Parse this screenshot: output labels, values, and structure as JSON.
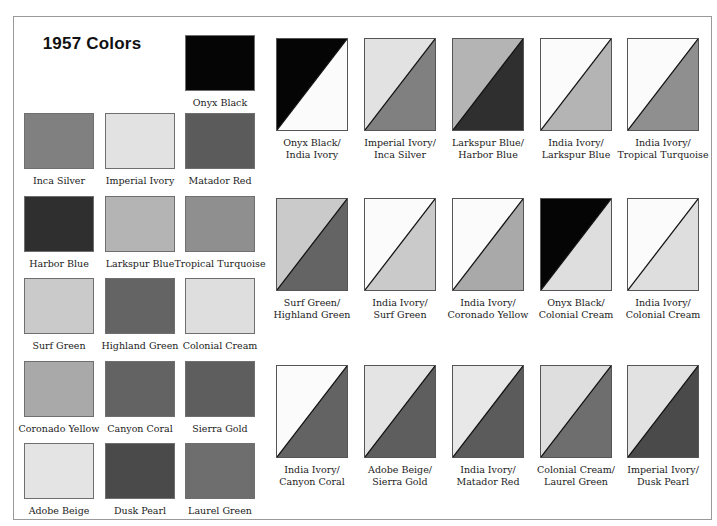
{
  "title": "1957 Colors",
  "colors": {
    "onyx_black": "#050505",
    "india_ivory": "#fbfbfb",
    "inca_silver": "#808080",
    "imperial_ivory": "#e2e2e2",
    "matador_red": "#5b5b5b",
    "harbor_blue": "#2f2f2f",
    "larkspur_blue": "#b4b4b4",
    "tropical_turquoise": "#8f8f8f",
    "surf_green": "#cacaca",
    "highland_green": "#646464",
    "colonial_cream": "#dedede",
    "coronado_yellow": "#a9a9a9",
    "canyon_coral": "#636363",
    "sierra_gold": "#5e5e5e",
    "adobe_beige": "#e4e4e4",
    "dusk_pearl": "#4a4a4a",
    "laurel_green": "#6e6e6e"
  },
  "solid_swatches": [
    {
      "label": "Onyx Black",
      "color": "#050505"
    },
    {
      "label": "Inca Silver",
      "color": "#808080"
    },
    {
      "label": "Imperial Ivory",
      "color": "#e2e2e2"
    },
    {
      "label": "Matador Red",
      "color": "#5b5b5b"
    },
    {
      "label": "Harbor Blue",
      "color": "#2f2f2f"
    },
    {
      "label": "Larkspur Blue",
      "color": "#b4b4b4"
    },
    {
      "label": "Tropical Turquoise",
      "color": "#8f8f8f"
    },
    {
      "label": "Surf Green",
      "color": "#cacaca"
    },
    {
      "label": "Highland Green",
      "color": "#646464"
    },
    {
      "label": "Colonial Cream",
      "color": "#dedede"
    },
    {
      "label": "Coronado Yellow",
      "color": "#a9a9a9"
    },
    {
      "label": "Canyon Coral",
      "color": "#636363"
    },
    {
      "label": "Sierra Gold",
      "color": "#5e5e5e"
    },
    {
      "label": "Adobe Beige",
      "color": "#e4e4e4"
    },
    {
      "label": "Dusk Pearl",
      "color": "#4a4a4a"
    },
    {
      "label": "Laurel Green",
      "color": "#6e6e6e"
    }
  ],
  "two_tone_combos": [
    {
      "line1": "Onyx Black/",
      "line2": "India Ivory",
      "upper": "#050505",
      "lower": "#fbfbfb"
    },
    {
      "line1": "Imperial Ivory/",
      "line2": "Inca Silver",
      "upper": "#e2e2e2",
      "lower": "#808080"
    },
    {
      "line1": "Larkspur Blue/",
      "line2": "Harbor Blue",
      "upper": "#b4b4b4",
      "lower": "#2f2f2f"
    },
    {
      "line1": "India Ivory/",
      "line2": "Larkspur Blue",
      "upper": "#fbfbfb",
      "lower": "#b4b4b4"
    },
    {
      "line1": "India Ivory/",
      "line2": "Tropical Turquoise",
      "upper": "#fbfbfb",
      "lower": "#8f8f8f"
    },
    {
      "line1": "Surf Green/",
      "line2": "Highland Green",
      "upper": "#cacaca",
      "lower": "#646464"
    },
    {
      "line1": "India Ivory/",
      "line2": "Surf Green",
      "upper": "#fbfbfb",
      "lower": "#cacaca"
    },
    {
      "line1": "India Ivory/",
      "line2": "Coronado Yellow",
      "upper": "#fbfbfb",
      "lower": "#a9a9a9"
    },
    {
      "line1": "Onyx Black/",
      "line2": "Colonial Cream",
      "upper": "#050505",
      "lower": "#dedede"
    },
    {
      "line1": "India Ivory/",
      "line2": "Colonial Cream",
      "upper": "#fbfbfb",
      "lower": "#dedede"
    },
    {
      "line1": "India Ivory/",
      "line2": "Canyon Coral",
      "upper": "#fbfbfb",
      "lower": "#636363"
    },
    {
      "line1": "Adobe Beige/",
      "line2": "Sierra Gold",
      "upper": "#e4e4e4",
      "lower": "#5e5e5e"
    },
    {
      "line1": "India Ivory/",
      "line2": "Matador Red",
      "upper": "#e8e8e8",
      "lower": "#5b5b5b"
    },
    {
      "line1": "Colonial Cream/",
      "line2": "Laurel Green",
      "upper": "#dedede",
      "lower": "#6e6e6e"
    },
    {
      "line1": "Imperial Ivory/",
      "line2": "Dusk Pearl",
      "upper": "#e2e2e2",
      "lower": "#4a4a4a"
    }
  ]
}
